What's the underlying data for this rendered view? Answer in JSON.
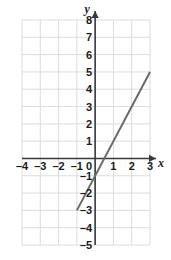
{
  "figure": {
    "name": "coordinate-plane-line-graph",
    "width": 171,
    "height": 260,
    "background_color": "#ffffff"
  },
  "chart_data": {
    "type": "line",
    "title": "",
    "xlabel": "x",
    "ylabel": "y",
    "xlim": [
      -4,
      3
    ],
    "ylim": [
      -5,
      8
    ],
    "grid": true,
    "grid_color": "#dcdcdc",
    "axis_color": "#3a3a3a",
    "legend": "none",
    "xticks": [
      -4,
      -3,
      -2,
      -1,
      0,
      1,
      2,
      3
    ],
    "xtick_labels": [
      "–4",
      "–3",
      "–2",
      "–1",
      "0",
      "1",
      "2",
      "3"
    ],
    "yticks": [
      8,
      7,
      6,
      5,
      4,
      3,
      2,
      1,
      -1,
      -2,
      -3,
      -4,
      -5
    ],
    "ytick_labels": [
      "8",
      "7",
      "6",
      "5",
      "4",
      "3",
      "2",
      "1",
      "–1",
      "–2",
      "–3",
      "–4",
      "–5"
    ],
    "series": [
      {
        "name": "line-y-equals-2x-minus-1",
        "color": "#6a6a6a",
        "width": 2,
        "slope": 2,
        "intercept": -1,
        "x": [
          -1,
          3
        ],
        "y": [
          -3,
          5
        ],
        "points": [
          {
            "x": -1,
            "y": -3
          },
          {
            "x": 0,
            "y": -1
          },
          {
            "x": 1,
            "y": 1
          },
          {
            "x": 2,
            "y": 3
          },
          {
            "x": 3,
            "y": 5
          }
        ]
      }
    ]
  },
  "axes": {
    "x_axis_label": "x",
    "y_axis_label": "y",
    "x_arrow": "arrow-right",
    "y_arrow": "arrow-up",
    "origin_label": "0"
  }
}
